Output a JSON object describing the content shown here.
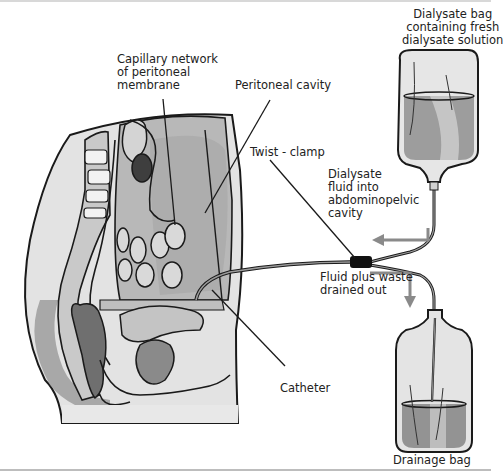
{
  "diagram": {
    "labels": {
      "dialysate_bag": "Dialysate bag\ncontaining fresh\ndialysate solution",
      "capillary_network": "Capillary network\nof peritoneal\nmembrane",
      "peritoneal_cavity": "Peritoneal cavity",
      "twist_clamp": "Twist - clamp",
      "dialysate_fluid_in": "Dialysate\nfluid into\nabdominopelvic\ncavity",
      "fluid_drained": "Fluid plus waste\ndrained out",
      "catheter": "Catheter",
      "drainage_bag": "Drainage bag"
    },
    "colors": {
      "outline": "#1a1a1a",
      "tissue_light": "#d6d6d6",
      "tissue_mid": "#a9a9a9",
      "tissue_dark": "#7d7d7d",
      "fluid": "#9a9a9a",
      "arrow": "#8a8a8a",
      "clamp": "#111111"
    }
  }
}
